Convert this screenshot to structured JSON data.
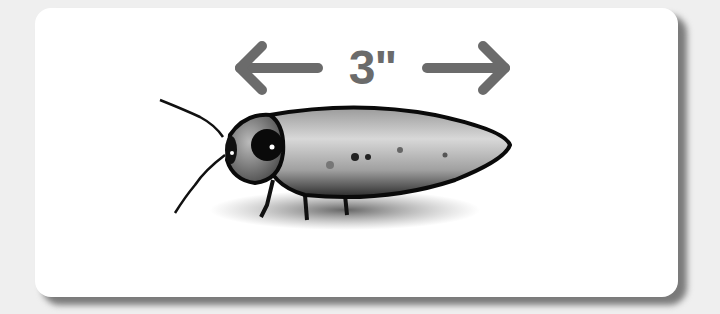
{
  "figure": {
    "measurement_label": "3\"",
    "arrow_color": "#6b6b6b",
    "card_background": "#ffffff",
    "page_background": "#efefef",
    "icons": [
      "left-arrow-icon",
      "right-arrow-icon"
    ]
  }
}
